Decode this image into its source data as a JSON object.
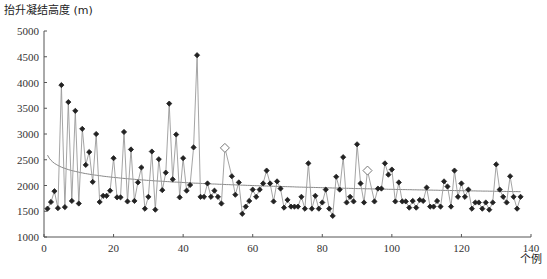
{
  "chart_data": {
    "type": "line",
    "title": "",
    "ylabel": "抬升凝结高度 (m)",
    "xlabel": "个例",
    "xlim": [
      0,
      140
    ],
    "ylim": [
      1000,
      5000
    ],
    "x_ticks": [
      0,
      20,
      40,
      60,
      80,
      100,
      120,
      140
    ],
    "y_ticks": [
      1000,
      1500,
      2000,
      2500,
      3000,
      3500,
      4000,
      4500,
      5000
    ],
    "grid": false,
    "legend": null,
    "series": [
      {
        "name": "抬升凝结高度",
        "marker": "filled-diamond",
        "color": "#222222",
        "line_color": "#999999",
        "x": [
          1,
          2,
          3,
          4,
          5,
          6,
          7,
          8,
          9,
          10,
          11,
          12,
          13,
          14,
          15,
          16,
          17,
          18,
          19,
          20,
          21,
          22,
          23,
          24,
          25,
          26,
          27,
          28,
          29,
          30,
          31,
          32,
          33,
          34,
          35,
          36,
          37,
          38,
          39,
          40,
          41,
          42,
          43,
          44,
          45,
          46,
          47,
          48,
          49,
          50,
          51
        ],
        "values": [
          1550,
          1680,
          1890,
          1560,
          3950,
          1580,
          3620,
          1700,
          3450,
          1650,
          3100,
          2400,
          2650,
          2070,
          3000,
          1680,
          1800,
          1800,
          1900,
          2530,
          1770,
          1770,
          3040,
          1690,
          2700,
          1700,
          2060,
          2350,
          1550,
          1780,
          2660,
          1530,
          2510,
          1910,
          2250,
          3590,
          2120,
          2990,
          1770,
          2530,
          1900,
          2010,
          2740,
          4530,
          1780,
          1780,
          2040,
          1780,
          1900,
          1780,
          1650
        ]
      },
      {
        "name": "抬升凝结高度 (续)",
        "marker": "filled-diamond",
        "color": "#222222",
        "line_color": "#999999",
        "x": [
          54,
          55,
          56,
          57,
          58,
          59,
          60,
          61,
          62,
          63,
          64,
          65,
          66,
          67,
          68,
          69,
          70,
          71,
          72,
          73,
          74,
          75,
          76,
          77,
          78,
          79,
          80,
          81,
          82,
          83,
          84,
          85,
          86,
          87,
          88,
          89,
          90,
          91,
          92
        ],
        "values": [
          2180,
          1820,
          2060,
          1450,
          1590,
          1700,
          1920,
          1780,
          1920,
          2040,
          2290,
          2040,
          1690,
          2080,
          1940,
          1570,
          1720,
          1590,
          1590,
          1590,
          1780,
          1550,
          2430,
          1550,
          1800,
          1550,
          1670,
          1920,
          1550,
          1410,
          2170,
          1920,
          2550,
          1670,
          1780,
          1690,
          2800,
          2040,
          1670
        ]
      },
      {
        "name": "抬升凝结高度 (续2)",
        "marker": "filled-diamond",
        "color": "#222222",
        "line_color": "#999999",
        "x": [
          95,
          96,
          97,
          98,
          99,
          100,
          101,
          102,
          103,
          104,
          105,
          106,
          107,
          108,
          109,
          110,
          111,
          112,
          113,
          114,
          115,
          116,
          117,
          118,
          119,
          120,
          121,
          122,
          123,
          124,
          125,
          126,
          127,
          128,
          129,
          130,
          131,
          132,
          133,
          134,
          135,
          136,
          137
        ],
        "values": [
          1690,
          1940,
          1940,
          2430,
          2210,
          2310,
          1690,
          2060,
          1690,
          1690,
          1570,
          1700,
          1570,
          1720,
          1700,
          1960,
          1590,
          1590,
          1700,
          1590,
          2080,
          1980,
          1590,
          2290,
          1780,
          2040,
          1780,
          1920,
          1550,
          1670,
          1670,
          1550,
          1670,
          1530,
          1670,
          2410,
          1920,
          1780,
          1670,
          2180,
          1780,
          1550,
          1780
        ]
      },
      {
        "name": "特殊个例",
        "marker": "open-diamond",
        "color": "#888888",
        "x": [
          52,
          93
        ],
        "values": [
          2730,
          2290
        ]
      },
      {
        "name": "对数拟合趋势线",
        "type": "trendline",
        "color": "#888888",
        "x": [
          1,
          5,
          10,
          20,
          40,
          60,
          80,
          100,
          120,
          137
        ],
        "values": [
          2590,
          2360,
          2250,
          2150,
          2050,
          2000,
          1960,
          1930,
          1900,
          1880
        ]
      }
    ]
  }
}
